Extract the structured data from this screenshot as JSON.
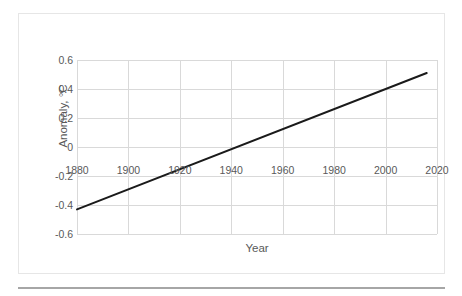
{
  "chart_data": {
    "type": "line",
    "title": "",
    "xlabel": "Year",
    "ylabel": "Anomaly, °C",
    "xlim": [
      1880,
      2020
    ],
    "ylim": [
      -0.6,
      0.6
    ],
    "grid": true,
    "legend": null,
    "xticks": [
      "1880",
      "1900",
      "1920",
      "1940",
      "1960",
      "1980",
      "2000",
      "2020"
    ],
    "xtick_values": [
      1880,
      1900,
      1920,
      1940,
      1960,
      1980,
      2000,
      2020
    ],
    "yticks": [
      "0.6",
      "0.4",
      "0.2",
      "0",
      "-0.2",
      "-0.4",
      "-0.6"
    ],
    "ytick_values": [
      0.6,
      0.4,
      0.2,
      0,
      -0.2,
      -0.4,
      -0.6
    ],
    "series": [
      {
        "name": "Global temperature anomaly trend",
        "color": "#1a1a1a",
        "line_width": 2,
        "x": [
          1880,
          2016
        ],
        "values": [
          -0.43,
          0.51
        ]
      }
    ],
    "annotations": [],
    "zero_crossing_year": 1942
  },
  "style": {
    "grid_color": "#d9d9d9",
    "tick_label_color": "#595959",
    "axis_title_color": "#595959",
    "card_border_color": "#e6e6e6",
    "rule_color": "#a6a6a6",
    "background": "#ffffff"
  }
}
